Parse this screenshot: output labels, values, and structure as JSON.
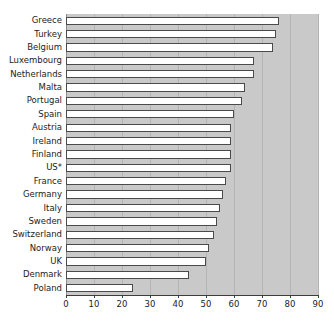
{
  "chart_data": {
    "type": "bar",
    "orientation": "horizontal",
    "title": "",
    "subtitle": "",
    "xlabel": "",
    "ylabel": "",
    "xlim": [
      0,
      90
    ],
    "ylim": null,
    "grid": true,
    "legend": null,
    "legend_position": "none",
    "xticks": [
      0,
      10,
      20,
      30,
      40,
      50,
      60,
      70,
      80,
      90
    ],
    "categories": [
      "Greece",
      "Turkey",
      "Belgium",
      "Luxembourg",
      "Netherlands",
      "Malta",
      "Portugal",
      "Spain",
      "Austria",
      "Ireland",
      "Finland",
      "US*",
      "France",
      "Germany",
      "Italy",
      "Sweden",
      "Switzerland",
      "Norway",
      "UK",
      "Denmark",
      "Poland"
    ],
    "values": [
      76,
      75,
      74,
      67,
      67,
      64,
      63,
      60,
      59,
      59,
      59,
      59,
      57,
      56,
      55,
      54,
      53,
      51,
      50,
      44,
      24
    ],
    "annotations": [
      "US* denotes United States"
    ]
  },
  "style": {
    "plot_background": "#c9c9c9",
    "bar_fill": "#ffffff",
    "bar_edge": "#4a4a4a",
    "gridline_color": "#b4b4b4",
    "axis_color": "#3d3d3d",
    "text_color": "#1c1c1c"
  }
}
